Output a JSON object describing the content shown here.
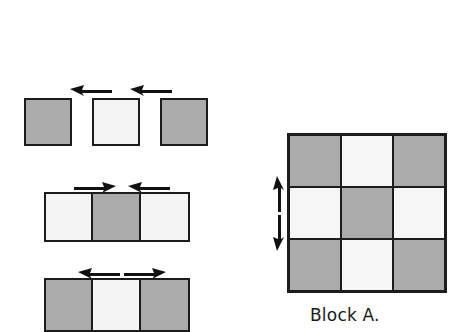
{
  "figure": {
    "background_color": "#ffffff",
    "outline_color": "#1c1c1c",
    "gray_fill": "#ababab",
    "light_fill": "#f4f4f4",
    "block_label": "Block A."
  },
  "left_diagram": {
    "rows": [
      {
        "name": "row-separated-squares",
        "joined": false,
        "cells": [
          {
            "shade": "gray"
          },
          {
            "shade": "light"
          },
          {
            "shade": "gray"
          }
        ],
        "arrows": [
          {
            "name": "arrow-left",
            "direction": "left"
          },
          {
            "name": "arrow-right",
            "direction": "right"
          }
        ]
      },
      {
        "name": "row-joined-light-gray-light",
        "joined": true,
        "cells": [
          {
            "shade": "light"
          },
          {
            "shade": "gray"
          },
          {
            "shade": "light"
          }
        ],
        "arrows": [
          {
            "name": "arrow-right",
            "direction": "right"
          },
          {
            "name": "arrow-left",
            "direction": "left"
          }
        ]
      },
      {
        "name": "row-joined-gray-light-gray",
        "joined": true,
        "cells": [
          {
            "shade": "gray"
          },
          {
            "shade": "light"
          },
          {
            "shade": "gray"
          }
        ],
        "arrows": [
          {
            "name": "arrow-left",
            "direction": "left"
          },
          {
            "name": "arrow-right",
            "direction": "right"
          }
        ]
      }
    ]
  },
  "right_diagram": {
    "name": "block-a",
    "label": "Block A.",
    "grid": [
      [
        "gray",
        "light",
        "gray"
      ],
      [
        "light",
        "gray",
        "light"
      ],
      [
        "gray",
        "light",
        "gray"
      ]
    ],
    "arrows": [
      {
        "name": "arrow-up",
        "direction": "up"
      },
      {
        "name": "arrow-down",
        "direction": "down"
      }
    ]
  }
}
